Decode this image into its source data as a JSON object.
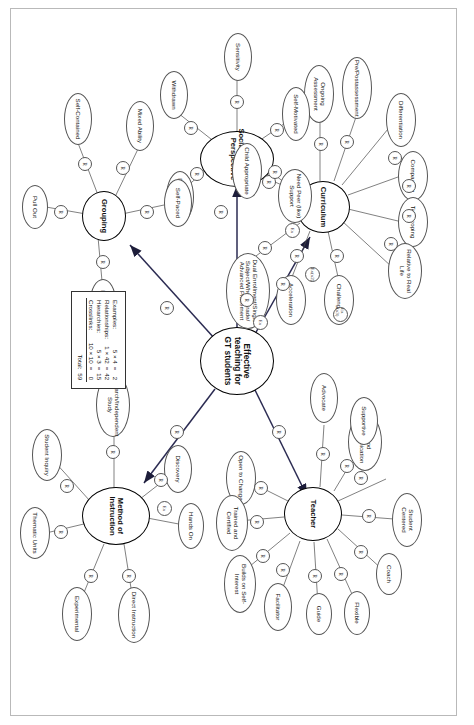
{
  "diagram": {
    "center": {
      "label": "Effective teaching for GT students"
    },
    "branches": [
      {
        "id": "curriculum",
        "label": "Curriculum"
      },
      {
        "id": "teacher",
        "label": "Teacher"
      },
      {
        "id": "social_emotional",
        "label": "Social/Emotional Perspective"
      },
      {
        "id": "grouping",
        "label": "Grouping"
      },
      {
        "id": "method",
        "label": "Method of Instruction"
      }
    ],
    "leaves": {
      "curriculum": [
        "Differentiation",
        "Compacting",
        "Telescoping",
        "Relative to Real Life",
        "Challenging",
        "Acceleration",
        "Dual Enrollment/Single Subject/Whole Grade/ Advanced Placement",
        "Ongoing Assessment",
        "Pre/Postassessment",
        "Child Appropriate"
      ],
      "teacher": [
        "Good Communication",
        "Student Centered",
        "Coach",
        "Flexible",
        "Guide",
        "Facilitator",
        "Advocate",
        "Supportive",
        "Open to Change",
        "Trained and Certified",
        "Builds on Self-Interest"
      ],
      "social_emotional": [
        "Self-Motivated",
        "Need Peer (like) Support",
        "Sensitivity",
        "Withdrawn",
        "Perfectionism"
      ],
      "grouping": [
        "Self-Paced",
        "Mixed Ability",
        "Flexible",
        "Self-Contained",
        "Pull Out"
      ],
      "method": [
        "Discovery",
        "Hands On",
        "Direct Instruction",
        "Experimental",
        "Thematic Units",
        "Student Inquiry",
        "Research/Independent Study"
      ]
    },
    "markers": {
      "relationship": "R",
      "example": "Ex",
      "example_multi": "Ex (x3)",
      "example_two": "Ex(x2)"
    },
    "legend": {
      "rows": [
        {
          "label": "Examples:",
          "expr": "5 × 4",
          "eq": "=",
          "value": "2"
        },
        {
          "label": "Relationships:",
          "expr": "1 × 42",
          "eq": "=",
          "value": "42"
        },
        {
          "label": "Hierarchies:",
          "expr": "5 × 3",
          "eq": "=",
          "value": "15"
        },
        {
          "label": "Crosslinks:",
          "expr": "10 × 10",
          "eq": "=",
          "value": "0"
        }
      ],
      "total_label": "Total:",
      "total_value": "59"
    }
  }
}
